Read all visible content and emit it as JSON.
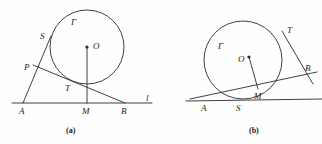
{
  "figure": {
    "background_color": "#fefefe",
    "stroke_color": "#2b2b2b",
    "label_color": "#222222",
    "panels": [
      {
        "caption": "(a)",
        "caption_x": 66,
        "caption_y": 127,
        "circle": {
          "cx": 87,
          "cy": 47,
          "r": 37,
          "label": "Γ",
          "label_x": 71,
          "label_y": 18
        },
        "center_point": {
          "x": 87,
          "y": 47,
          "label": "O",
          "label_x": 93,
          "label_y": 42
        },
        "baseline": {
          "x1": 12,
          "y1": 103,
          "x2": 152,
          "y2": 103,
          "label": "l",
          "label_x": 146,
          "label_y": 94
        },
        "points": [
          {
            "name": "A",
            "x": 23,
            "y": 103,
            "label": "A",
            "label_x": 19,
            "label_y": 107
          },
          {
            "name": "M",
            "x": 87,
            "y": 103,
            "label": "M",
            "label_x": 82,
            "label_y": 107
          },
          {
            "name": "B",
            "x": 125,
            "y": 103,
            "label": "B",
            "label_x": 121,
            "label_y": 107
          },
          {
            "name": "S",
            "x": 51,
            "y": 36,
            "label": "S",
            "label_x": 40,
            "label_y": 32
          },
          {
            "name": "P",
            "x": 33,
            "y": 65,
            "label": "P",
            "label_x": 24,
            "label_y": 63
          },
          {
            "name": "T",
            "x": 73,
            "y": 81,
            "label": "T",
            "label_x": 65,
            "label_y": 84
          }
        ],
        "segments": [
          {
            "name": "line-A-to-S",
            "x1": 23,
            "y1": 103,
            "x2": 51,
            "y2": 36
          },
          {
            "name": "line-P-to-B",
            "x1": 33,
            "y1": 65,
            "x2": 125,
            "y2": 103
          },
          {
            "name": "radius-O-to-M",
            "x1": 87,
            "y1": 47,
            "x2": 87,
            "y2": 103
          }
        ]
      },
      {
        "caption": "(b)",
        "caption_x": 249,
        "caption_y": 127,
        "circle": {
          "cx": 243,
          "cy": 60,
          "r": 39,
          "label": "Γ",
          "label_x": 218,
          "label_y": 42
        },
        "center_point": {
          "x": 249,
          "y": 57,
          "label": "O",
          "label_x": 238,
          "label_y": 55
        },
        "baseline": {
          "x1": 186,
          "y1": 101,
          "x2": 322,
          "y2": 99,
          "label": "",
          "label_x": 0,
          "label_y": 0
        },
        "points": [
          {
            "name": "A",
            "x": 204,
            "y": 100,
            "label": "A",
            "label_x": 201,
            "label_y": 104
          },
          {
            "name": "S",
            "x": 240,
            "y": 99,
            "label": "S",
            "label_x": 236,
            "label_y": 104
          },
          {
            "name": "M",
            "x": 258,
            "y": 89,
            "label": "M",
            "label_x": 254,
            "label_y": 92
          },
          {
            "name": "T",
            "x": 282,
            "y": 31,
            "label": "T",
            "label_x": 287,
            "label_y": 26
          },
          {
            "name": "B",
            "x": 302,
            "y": 70,
            "label": "B",
            "label_x": 305,
            "label_y": 64
          }
        ],
        "segments": [
          {
            "name": "secant-A-through-M-to-B",
            "x1": 190,
            "y1": 99,
            "x2": 317,
            "y2": 72
          },
          {
            "name": "tangent-T-to-beyond-B",
            "x1": 282,
            "y1": 31,
            "x2": 313,
            "y2": 84
          },
          {
            "name": "radius-O-to-M",
            "x1": 249,
            "y1": 57,
            "x2": 258,
            "y2": 89
          }
        ]
      }
    ]
  }
}
